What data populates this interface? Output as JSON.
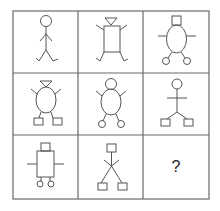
{
  "puzzle": {
    "rows": 3,
    "cols": 3,
    "cells": [
      {
        "row": 1,
        "col": 1,
        "head": "circle",
        "body": "line",
        "arms": "angled-lines",
        "feet": "hooks"
      },
      {
        "row": 1,
        "col": 2,
        "head": "triangle",
        "body": "rectangle",
        "arms": "angled-lines",
        "feet": "hooks"
      },
      {
        "row": 1,
        "col": 3,
        "head": "square",
        "body": "oval",
        "arms": "horizontal-lines",
        "feet": "circles"
      },
      {
        "row": 2,
        "col": 1,
        "head": "triangle",
        "body": "oval",
        "arms": "angled-lines",
        "feet": "squares"
      },
      {
        "row": 2,
        "col": 2,
        "head": "circle",
        "body": "oval",
        "arms": "angled-lines",
        "feet": "circles"
      },
      {
        "row": 2,
        "col": 3,
        "head": "circle",
        "body": "line",
        "arms": "horizontal-lines",
        "feet": "squares"
      },
      {
        "row": 3,
        "col": 1,
        "head": "square",
        "body": "rectangle",
        "arms": "horizontal-lines",
        "feet": "circles"
      },
      {
        "row": 3,
        "col": 2,
        "head": "square",
        "body": "line",
        "arms": "angled-lines",
        "feet": "squares"
      },
      {
        "row": 3,
        "col": 3,
        "missing": true,
        "label": "?"
      }
    ],
    "colors": {
      "line": "#555555",
      "grid": "#6a6a6a",
      "background": "#ffffff"
    }
  }
}
